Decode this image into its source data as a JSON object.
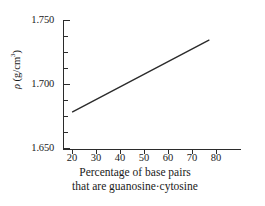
{
  "chart_data": {
    "type": "line",
    "title": "",
    "xlabel": "Percentage of base pairs that are guanosine·cytosine",
    "xlabel_line1": "Percentage of base pairs",
    "xlabel_line2": "that are guanosine·cytosine",
    "ylabel": "ρ (g/cm3)",
    "ylabel_symbol": "ρ",
    "ylabel_units_pre": " (g/cm",
    "ylabel_units_exp": "3",
    "ylabel_units_post": ")",
    "xlim": [
      15,
      89
    ],
    "ylim": [
      1.65,
      1.75
    ],
    "xticks": [
      20,
      30,
      40,
      50,
      60,
      70,
      80
    ],
    "xtick_labels": [
      "20",
      "30",
      "40",
      "50",
      "60",
      "70",
      "80"
    ],
    "yticks": [
      1.65,
      1.7,
      1.75
    ],
    "ytick_labels": [
      "1.650",
      "1.700",
      "1.750"
    ],
    "yticks_minor": [
      1.6625,
      1.675,
      1.6875,
      1.7125,
      1.725,
      1.7375
    ],
    "grid": false,
    "legend": null,
    "series": [
      {
        "name": "density vs GC percentage",
        "color": "#2b2b2b",
        "x": [
          19,
          76
        ],
        "y": [
          1.679,
          1.735
        ]
      }
    ]
  },
  "style": {
    "axis_color": "#2b2b2b",
    "line_color": "#2b2b2b",
    "background": "#ffffff",
    "text_color": "#1a1a1a"
  }
}
